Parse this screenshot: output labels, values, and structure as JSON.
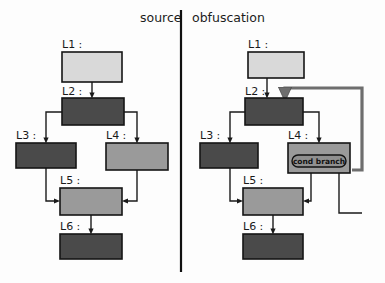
{
  "figure": {
    "width": 385,
    "height": 283,
    "background": "#fdfdfd"
  },
  "colors": {
    "block_light": "#d9d9d9",
    "block_medium": "#9a9a9a",
    "block_dark": "#4a4a4a",
    "block_stroke": "#141414",
    "edge": "#1a1a1a",
    "edge_thick": "#6e6e6e",
    "divider": "#111111",
    "chip_fill": "#8f8f8f",
    "text": "#1a1a1a"
  },
  "panels": [
    {
      "id": "source",
      "title": "source",
      "title_x": 140,
      "title_y": 22,
      "nodes": [
        {
          "id": "L1",
          "label": "L1 :",
          "x": 62,
          "y": 52,
          "w": 60,
          "h": 30,
          "shade": "light",
          "label_x": 62,
          "label_y": 48
        },
        {
          "id": "L2",
          "label": "L2 :",
          "x": 62,
          "y": 98,
          "w": 62,
          "h": 27,
          "shade": "dark",
          "label_x": 62,
          "label_y": 95
        },
        {
          "id": "L3",
          "label": "L3 :",
          "x": 16,
          "y": 143,
          "w": 60,
          "h": 25,
          "shade": "dark",
          "label_x": 16,
          "label_y": 139
        },
        {
          "id": "L4",
          "label": "L4 :",
          "x": 106,
          "y": 143,
          "w": 62,
          "h": 27,
          "shade": "medium",
          "label_x": 106,
          "label_y": 139
        },
        {
          "id": "L5",
          "label": "L5 :",
          "x": 60,
          "y": 188,
          "w": 62,
          "h": 27,
          "shade": "medium",
          "label_x": 60,
          "label_y": 184
        },
        {
          "id": "L6",
          "label": "L6 :",
          "x": 60,
          "y": 234,
          "w": 62,
          "h": 25,
          "shade": "dark",
          "label_x": 60,
          "label_y": 230
        }
      ],
      "edges": [
        {
          "from": "L1",
          "to": "L2",
          "kind": "straight-down"
        },
        {
          "from": "L2",
          "to": "L3",
          "kind": "branch-left"
        },
        {
          "from": "L2",
          "to": "L4",
          "kind": "branch-right"
        },
        {
          "from": "L3",
          "to": "L5",
          "kind": "merge-from-left"
        },
        {
          "from": "L4",
          "to": "L5",
          "kind": "merge-from-right"
        },
        {
          "from": "L5",
          "to": "L6",
          "kind": "straight-down"
        }
      ]
    },
    {
      "id": "obfuscation",
      "title": "obfuscation",
      "title_x": 192,
      "title_y": 22,
      "nodes": [
        {
          "id": "L1",
          "label": "L1 :",
          "x": 248,
          "y": 52,
          "w": 56,
          "h": 26,
          "shade": "light",
          "label_x": 248,
          "label_y": 48
        },
        {
          "id": "L2",
          "label": "L2 :",
          "x": 245,
          "y": 98,
          "w": 58,
          "h": 27,
          "shade": "dark",
          "label_x": 245,
          "label_y": 95
        },
        {
          "id": "L3",
          "label": "L3 :",
          "x": 200,
          "y": 143,
          "w": 58,
          "h": 25,
          "shade": "dark",
          "label_x": 200,
          "label_y": 139
        },
        {
          "id": "L4",
          "label": "L4 :",
          "x": 288,
          "y": 143,
          "w": 62,
          "h": 30,
          "shade": "medium",
          "label_x": 288,
          "label_y": 139
        },
        {
          "id": "L5",
          "label": "L5 :",
          "x": 243,
          "y": 188,
          "w": 60,
          "h": 27,
          "shade": "medium",
          "label_x": 243,
          "label_y": 184
        },
        {
          "id": "L6",
          "label": "L6 :",
          "x": 243,
          "y": 234,
          "w": 60,
          "h": 25,
          "shade": "dark",
          "label_x": 243,
          "label_y": 230
        }
      ],
      "chips": [
        {
          "id": "cond-branch",
          "label": "cond branch",
          "x": 292,
          "y": 156,
          "w": 54,
          "h": 11,
          "in_node": "L4"
        }
      ],
      "edges": [
        {
          "from": "L1",
          "to": "L2",
          "kind": "straight-down"
        },
        {
          "from": "loop",
          "to": "L2",
          "kind": "back-edge-thick"
        },
        {
          "from": "L2",
          "to": "L3",
          "kind": "branch-left"
        },
        {
          "from": "L2",
          "to": "L4",
          "kind": "branch-right"
        },
        {
          "from": "L3",
          "to": "L5",
          "kind": "merge-from-left"
        },
        {
          "from": "cond-branch",
          "to": "L5",
          "kind": "merge-from-right"
        },
        {
          "from": "cond-branch",
          "to": "L2",
          "kind": "loop-back-right"
        },
        {
          "from": "L5",
          "to": "L6",
          "kind": "straight-down"
        }
      ]
    }
  ],
  "divider": {
    "x": 181,
    "y1": 10,
    "y2": 272
  }
}
